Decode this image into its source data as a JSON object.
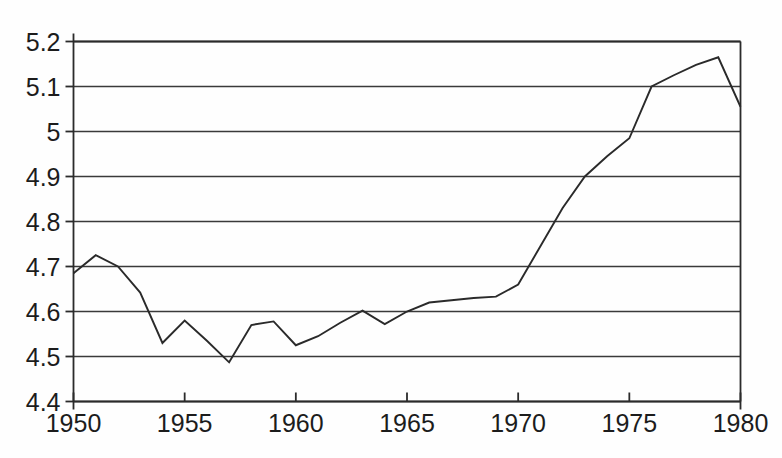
{
  "chart_data": {
    "type": "line",
    "title": "",
    "subtitle": "",
    "xlabel": "",
    "ylabel": "",
    "xlim": [
      1950,
      1980
    ],
    "ylim": [
      4.4,
      5.2
    ],
    "grid": true,
    "legend": null,
    "x_ticks": [
      "1950",
      "1955",
      "1960",
      "1965",
      "1970",
      "1975",
      "1980"
    ],
    "x_tick_values": [
      1950,
      1955,
      1960,
      1965,
      1970,
      1975,
      1980
    ],
    "y_ticks": [
      "4.4",
      "4.5",
      "4.6",
      "4.7",
      "4.8",
      "4.9",
      "5",
      "5.1",
      "5.2"
    ],
    "y_tick_values": [
      4.4,
      4.5,
      4.6,
      4.7,
      4.8,
      4.9,
      5.0,
      5.1,
      5.2
    ],
    "x": [
      1950,
      1951,
      1952,
      1953,
      1954,
      1955,
      1956,
      1957,
      1958,
      1959,
      1960,
      1961,
      1962,
      1963,
      1964,
      1965,
      1966,
      1967,
      1968,
      1969,
      1970,
      1971,
      1972,
      1973,
      1974,
      1975,
      1976,
      1977,
      1978,
      1979,
      1980
    ],
    "series": [
      {
        "name": "series-1",
        "color": "#2a2a2a",
        "values": [
          4.685,
          4.725,
          4.7,
          4.642,
          4.53,
          4.58,
          4.535,
          4.487,
          4.57,
          4.578,
          4.525,
          4.545,
          4.575,
          4.602,
          4.572,
          4.6,
          4.62,
          4.625,
          4.63,
          4.633,
          4.66,
          4.745,
          4.83,
          4.9,
          4.945,
          4.985,
          5.1,
          5.125,
          5.148,
          5.165,
          5.055
        ]
      }
    ]
  },
  "axes": {
    "y_axis_name": "y-axis",
    "x_axis_name": "x-axis"
  }
}
